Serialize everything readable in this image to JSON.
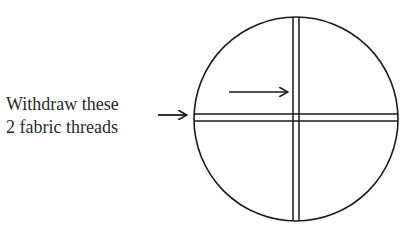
{
  "diagram": {
    "label_lines": [
      "Withdraw these",
      "2 fabric threads"
    ],
    "colors": {
      "ink": "#1a1a1a",
      "background": "#ffffff"
    },
    "circle": {
      "cx": 296,
      "cy": 119,
      "r": 102
    },
    "vertical_threads_x": [
      293,
      299
    ],
    "horizontal_threads_y": [
      114,
      121
    ],
    "arrows": [
      {
        "name": "label-arrow",
        "from": [
          158,
          115
        ],
        "to": [
          186,
          115
        ]
      },
      {
        "name": "inner-arrow",
        "from": [
          229,
          92
        ],
        "to": [
          287,
          92
        ]
      }
    ]
  }
}
